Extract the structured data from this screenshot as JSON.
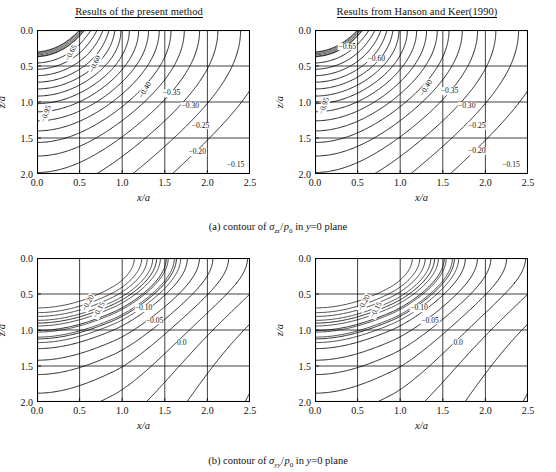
{
  "figure": {
    "captions": [
      {
        "id": "a",
        "prefix": "(a) contour of ",
        "symbol": "σ",
        "sub": "zz",
        "denom": "p",
        "denom_sub": "0",
        "suffix": " in ",
        "plane_var": "y",
        "plane_eq": "=0 plane"
      },
      {
        "id": "b",
        "prefix": "(b) contour of ",
        "symbol": "σ",
        "sub": "yy",
        "denom": "p",
        "denom_sub": "0",
        "suffix": " in ",
        "plane_var": "y",
        "plane_eq": "=0 plane"
      }
    ],
    "axes": {
      "xlabel": "x/a",
      "ylabel": "z/a",
      "xticks": [
        "0.0",
        "0.5",
        "1.0",
        "1.5",
        "2.0",
        "2.5"
      ],
      "yticks": [
        "0.0",
        "0.5",
        "1.0",
        "1.5",
        "2.0"
      ],
      "xlim": [
        0.0,
        2.5
      ],
      "ylim": [
        0.0,
        2.0
      ],
      "y_inverted": true,
      "grid": true
    },
    "panels": [
      {
        "id": "a-left",
        "title": "Results of the present method",
        "row": "a",
        "side": "left"
      },
      {
        "id": "a-right",
        "title": "Results from Hanson and Keer(1990)",
        "row": "a",
        "side": "right"
      },
      {
        "id": "b-left",
        "title": "",
        "row": "b",
        "side": "left"
      },
      {
        "id": "b-right",
        "title": "",
        "row": "b",
        "side": "right"
      }
    ]
  },
  "chart_data": [
    {
      "id": "a-left",
      "type": "contour",
      "title": "Results of the present method",
      "xlabel": "x/a",
      "ylabel": "z/a",
      "xlim": [
        0.0,
        2.5
      ],
      "ylim": [
        0.0,
        2.0
      ],
      "y_inverted": true,
      "grid": true,
      "quantity": "sigma_zz / p_0",
      "plane": "y=0",
      "levels": [
        -0.95,
        -0.9,
        -0.85,
        -0.8,
        -0.75,
        -0.7,
        -0.65,
        -0.6,
        -0.55,
        -0.5,
        -0.45,
        -0.4,
        -0.35,
        -0.3,
        -0.25,
        -0.2,
        -0.15
      ],
      "labeled_levels": [
        {
          "value": "-0.95",
          "x": 0.1,
          "z": 1.16,
          "rot": -70
        },
        {
          "value": "-0.65",
          "x": 0.4,
          "z": 0.32,
          "rot": -62
        },
        {
          "value": "-0.60",
          "x": 0.68,
          "z": 0.47,
          "rot": -66
        },
        {
          "value": "-0.40",
          "x": 1.27,
          "z": 0.83,
          "rot": -60
        },
        {
          "value": "-0.35",
          "x": 1.58,
          "z": 0.88,
          "rot": 0
        },
        {
          "value": "-0.30",
          "x": 1.8,
          "z": 1.05,
          "rot": 0
        },
        {
          "value": "-0.25",
          "x": 1.92,
          "z": 1.33,
          "rot": 0
        },
        {
          "value": "-0.20",
          "x": 1.88,
          "z": 1.7,
          "rot": 0
        },
        {
          "value": "-0.15",
          "x": 2.33,
          "z": 1.88,
          "rot": 0
        }
      ]
    },
    {
      "id": "a-right",
      "type": "contour",
      "title": "Results from Hanson and Keer(1990)",
      "xlabel": "x/a",
      "ylabel": "z/a",
      "xlim": [
        0.0,
        2.5
      ],
      "ylim": [
        0.0,
        2.0
      ],
      "y_inverted": true,
      "grid": true,
      "quantity": "sigma_zz / p_0",
      "plane": "y=0",
      "levels": [
        -0.95,
        -0.9,
        -0.85,
        -0.8,
        -0.75,
        -0.7,
        -0.65,
        -0.6,
        -0.55,
        -0.5,
        -0.45,
        -0.4,
        -0.35,
        -0.3,
        -0.25,
        -0.2,
        -0.15
      ],
      "labeled_levels": [
        {
          "value": "-0.95",
          "x": 0.1,
          "z": 1.05,
          "rot": -70
        },
        {
          "value": "-0.65",
          "x": 0.38,
          "z": 0.23,
          "rot": 0
        },
        {
          "value": "-0.60",
          "x": 0.72,
          "z": 0.4,
          "rot": 0
        },
        {
          "value": "-0.40",
          "x": 1.3,
          "z": 0.8,
          "rot": -60
        },
        {
          "value": "-0.35",
          "x": 1.58,
          "z": 0.85,
          "rot": 0
        },
        {
          "value": "-0.30",
          "x": 1.78,
          "z": 1.05,
          "rot": 0
        },
        {
          "value": "-0.25",
          "x": 1.9,
          "z": 1.34,
          "rot": 0
        },
        {
          "value": "-0.20",
          "x": 1.9,
          "z": 1.68,
          "rot": 0
        },
        {
          "value": "-0.15",
          "x": 2.3,
          "z": 1.88,
          "rot": 0
        }
      ]
    },
    {
      "id": "b-left",
      "type": "contour",
      "title": "",
      "xlabel": "x/a",
      "ylabel": "z/a",
      "xlim": [
        0.0,
        2.5
      ],
      "ylim": [
        0.0,
        2.0
      ],
      "y_inverted": true,
      "grid": true,
      "quantity": "sigma_yy / p_0",
      "plane": "y=0",
      "levels": [
        -0.5,
        -0.45,
        -0.4,
        -0.35,
        -0.3,
        -0.25,
        -0.2,
        -0.15,
        -0.1,
        -0.05,
        0.0
      ],
      "labeled_levels": [
        {
          "value": "-0.20",
          "x": 0.6,
          "z": 0.62,
          "rot": -62
        },
        {
          "value": "-0.15",
          "x": 0.73,
          "z": 0.72,
          "rot": -62
        },
        {
          "value": "-0.10",
          "x": 1.25,
          "z": 0.7,
          "rot": 0
        },
        {
          "value": "-0.05",
          "x": 1.38,
          "z": 0.87,
          "rot": 0
        },
        {
          "value": "0.0",
          "x": 1.7,
          "z": 1.18,
          "rot": 0
        }
      ]
    },
    {
      "id": "b-right",
      "type": "contour",
      "title": "",
      "xlabel": "x/a",
      "ylabel": "z/a",
      "xlim": [
        0.0,
        2.5
      ],
      "ylim": [
        0.0,
        2.0
      ],
      "y_inverted": true,
      "grid": true,
      "quantity": "sigma_yy / p_0",
      "plane": "y=0",
      "levels": [
        -0.5,
        -0.45,
        -0.4,
        -0.35,
        -0.3,
        -0.25,
        -0.2,
        -0.15,
        -0.1,
        -0.05,
        0.0
      ],
      "labeled_levels": [
        {
          "value": "-0.20",
          "x": 0.58,
          "z": 0.62,
          "rot": -62
        },
        {
          "value": "-0.15",
          "x": 0.72,
          "z": 0.72,
          "rot": -62
        },
        {
          "value": "-0.10",
          "x": 1.22,
          "z": 0.7,
          "rot": 0
        },
        {
          "value": "-0.05",
          "x": 1.35,
          "z": 0.87,
          "rot": 0
        },
        {
          "value": "0.0",
          "x": 1.68,
          "z": 1.18,
          "rot": 0
        }
      ]
    }
  ]
}
